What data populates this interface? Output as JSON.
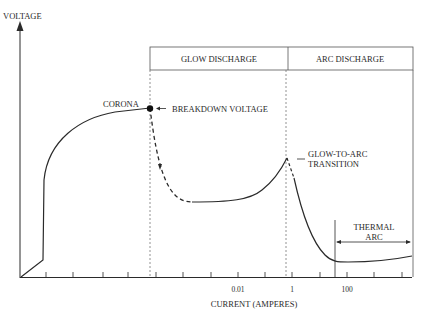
{
  "diagram": {
    "y_axis_label": "VOLTAGE",
    "x_axis_label": "CURRENT (AMPERES)",
    "x_tick_labels": [
      {
        "text": "0.01",
        "x": 238
      },
      {
        "text": "1",
        "x": 292
      },
      {
        "text": "100",
        "x": 347
      }
    ],
    "regions": {
      "glow": "GLOW DISCHARGE",
      "arc": "ARC DISCHARGE"
    },
    "annotations": {
      "corona": "CORONA",
      "breakdown": "BREAKDOWN VOLTAGE",
      "transition_line1": "GLOW-TO-ARC",
      "transition_line2": "TRANSITION",
      "thermal_line1": "THERMAL",
      "thermal_line2": "ARC"
    },
    "colors": {
      "line": "#2a2a2a",
      "background": "#ffffff"
    }
  }
}
